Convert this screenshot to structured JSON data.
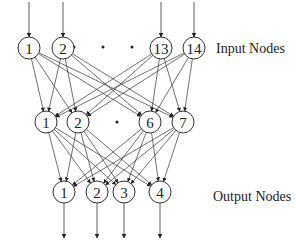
{
  "diagram": {
    "type": "neural-network",
    "layers": [
      {
        "name": "input",
        "label": "Input Nodes",
        "nodes": [
          {
            "id": "1",
            "x": 29,
            "y": 48
          },
          {
            "id": "2",
            "x": 63,
            "y": 48
          },
          {
            "id": "13",
            "x": 161,
            "y": 48
          },
          {
            "id": "14",
            "x": 194,
            "y": 48
          }
        ],
        "ellipsis_dots": [
          [
            74,
            47
          ],
          [
            103,
            47
          ],
          [
            132,
            47
          ]
        ]
      },
      {
        "name": "hidden",
        "label": "",
        "nodes": [
          {
            "id": "1",
            "x": 46,
            "y": 122
          },
          {
            "id": "2",
            "x": 78,
            "y": 122
          },
          {
            "id": "6",
            "x": 150,
            "y": 122
          },
          {
            "id": "7",
            "x": 183,
            "y": 122
          }
        ],
        "ellipsis_dots": [
          [
            88,
            122
          ],
          [
            117,
            122
          ]
        ]
      },
      {
        "name": "output",
        "label": "Output Nodes",
        "nodes": [
          {
            "id": "1",
            "x": 64,
            "y": 192
          },
          {
            "id": "2",
            "x": 97,
            "y": 192
          },
          {
            "id": "3",
            "x": 124,
            "y": 192
          },
          {
            "id": "4",
            "x": 160,
            "y": 192
          }
        ],
        "ellipsis_dots": []
      }
    ],
    "labels": {
      "input": "Input Nodes",
      "output": "Output Nodes"
    },
    "node_radius": 11,
    "connectivity": "fully-connected between adjacent layers",
    "colors": {
      "stroke": "#333333",
      "background": "#ffffff",
      "text": "#222222"
    }
  }
}
